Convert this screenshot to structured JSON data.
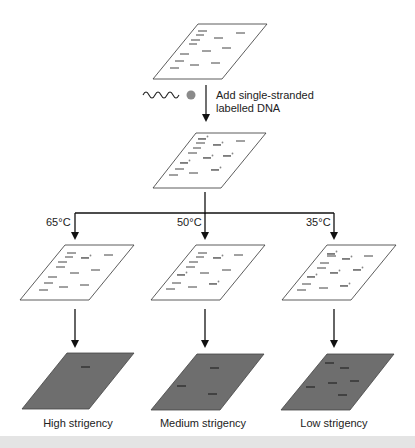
{
  "diagram": {
    "step_label_line1": "Add single-stranded",
    "step_label_line2": "labelled DNA",
    "temperatures": [
      "65°C",
      "50°C",
      "35°C"
    ],
    "results": [
      "High strigency",
      "Medium strigency",
      "Low strigency"
    ],
    "icons": {
      "probe": "wavy-dna-probe-with-label-dot",
      "membrane": "parallelogram-membrane",
      "hybrid": "probe-bound-band"
    },
    "colors": {
      "line": "#222222",
      "membrane_fill": "#ffffff",
      "autorad_fill": "#6e6e6e",
      "label_dot": "#8a8a8a",
      "band": "#333333"
    }
  }
}
